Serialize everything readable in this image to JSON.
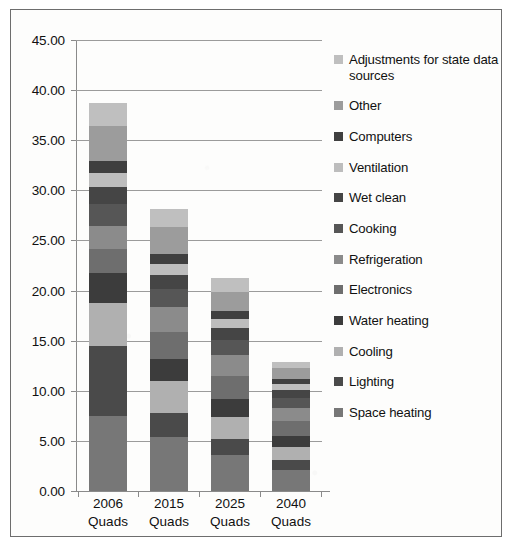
{
  "figure": {
    "border_color": "#6d6d6d"
  },
  "chart_data": {
    "type": "bar",
    "subtype": "stacked-bar",
    "title": "",
    "xlabel": "",
    "ylabel": "",
    "ylim": [
      0,
      45
    ],
    "ytick_step": 5,
    "grid": true,
    "legend_position": "right",
    "categories": [
      "2006\nQuads",
      "2015\nQuads",
      "2025\nQuads",
      "2040\nQuads"
    ],
    "category_lines": [
      [
        "2006",
        "Quads"
      ],
      [
        "2015",
        "Quads"
      ],
      [
        "2025",
        "Quads"
      ],
      [
        "2040",
        "Quads"
      ]
    ],
    "ytick_labels": [
      "0.00",
      "5.00",
      "10.00",
      "15.00",
      "20.00",
      "25.00",
      "30.00",
      "35.00",
      "40.00",
      "45.00"
    ],
    "ytick_values": [
      0,
      5,
      10,
      15,
      20,
      25,
      30,
      35,
      40,
      45
    ],
    "totals": [
      38.7,
      28.1,
      21.3,
      12.9
    ],
    "series": [
      {
        "name": "Space heating",
        "color": "#777777",
        "values": [
          7.5,
          5.4,
          3.6,
          2.1
        ]
      },
      {
        "name": "Lighting",
        "color": "#4a4a4a",
        "values": [
          7.0,
          2.4,
          1.6,
          1.0
        ]
      },
      {
        "name": "Cooling",
        "color": "#b0b0b0",
        "values": [
          4.3,
          3.2,
          2.2,
          1.3
        ]
      },
      {
        "name": "Water heating",
        "color": "#3c3c3c",
        "values": [
          3.0,
          2.2,
          1.8,
          1.1
        ]
      },
      {
        "name": "Electronics",
        "color": "#6e6e6e",
        "values": [
          2.4,
          2.7,
          2.3,
          1.5
        ]
      },
      {
        "name": "Refrigeration",
        "color": "#8b8b8b",
        "values": [
          2.2,
          2.5,
          2.1,
          1.3
        ]
      },
      {
        "name": "Cooking",
        "color": "#565656",
        "values": [
          2.2,
          1.8,
          1.5,
          1.0
        ]
      },
      {
        "name": "Wet clean",
        "color": "#454545",
        "values": [
          1.7,
          1.4,
          1.2,
          0.8
        ]
      },
      {
        "name": "Ventilation",
        "color": "#bdbdbd",
        "values": [
          1.4,
          1.1,
          0.9,
          0.6
        ]
      },
      {
        "name": "Computers",
        "color": "#3f3f3f",
        "values": [
          1.2,
          1.0,
          0.8,
          0.5
        ]
      },
      {
        "name": "Other",
        "color": "#9c9c9c",
        "values": [
          3.5,
          2.7,
          1.9,
          1.1
        ]
      },
      {
        "name": "Adjustments for state data sources",
        "color": "#bfbfbf",
        "values": [
          2.3,
          1.7,
          1.4,
          0.6
        ]
      }
    ]
  },
  "legend": {
    "items": [
      {
        "label": "Adjustments for state data sources",
        "color": "#bfbfbf"
      },
      {
        "label": "Other",
        "color": "#9c9c9c"
      },
      {
        "label": "Computers",
        "color": "#3f3f3f"
      },
      {
        "label": "Ventilation",
        "color": "#bdbdbd"
      },
      {
        "label": "Wet clean",
        "color": "#454545"
      },
      {
        "label": "Cooking",
        "color": "#565656"
      },
      {
        "label": "Refrigeration",
        "color": "#8b8b8b"
      },
      {
        "label": "Electronics",
        "color": "#6e6e6e"
      },
      {
        "label": "Water heating",
        "color": "#3c3c3c"
      },
      {
        "label": "Cooling",
        "color": "#b0b0b0"
      },
      {
        "label": "Lighting",
        "color": "#4a4a4a"
      },
      {
        "label": "Space heating",
        "color": "#777777"
      }
    ]
  }
}
